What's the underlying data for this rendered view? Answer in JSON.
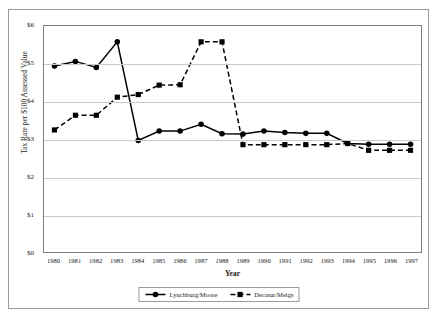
{
  "chart_data": {
    "type": "line",
    "title": "",
    "xlabel": "Year",
    "ylabel": "Tax Rate per $100 Assessed Value",
    "x": [
      1980,
      1981,
      1982,
      1983,
      1984,
      1985,
      1986,
      1987,
      1988,
      1989,
      1990,
      1991,
      1992,
      1993,
      1994,
      1995,
      1996,
      1997
    ],
    "categories": [
      "1980",
      "1981",
      "1982",
      "1983",
      "1984",
      "1985",
      "1986",
      "1987",
      "1988",
      "1989",
      "1990",
      "1991",
      "1992",
      "1993",
      "1994",
      "1995",
      "1996",
      "1997"
    ],
    "ylim": [
      0,
      6
    ],
    "yticks": [
      0,
      1,
      2,
      3,
      4,
      5,
      6
    ],
    "ytick_labels": [
      "$0",
      "$1",
      "$2",
      "$3",
      "$4",
      "$5",
      "$6"
    ],
    "grid": true,
    "legend_position": "bottom",
    "series": [
      {
        "name": "Lynchburg/Moore",
        "marker": "circle",
        "line_style": "solid",
        "color": "#000000",
        "values": [
          4.94,
          5.06,
          4.9,
          5.58,
          2.96,
          3.21,
          3.21,
          3.39,
          3.14,
          3.13,
          3.21,
          3.17,
          3.15,
          3.15,
          2.88,
          2.86,
          2.86,
          2.86
        ]
      },
      {
        "name": "Decatur/Meigs",
        "marker": "square",
        "line_style": "dashed",
        "color": "#000000",
        "values": [
          3.24,
          3.63,
          3.63,
          4.11,
          4.18,
          4.43,
          4.44,
          5.58,
          5.58,
          2.85,
          2.85,
          2.85,
          2.85,
          2.85,
          2.88,
          2.7,
          2.7,
          2.7
        ]
      }
    ]
  },
  "legend": {
    "items": [
      {
        "label": "Lynchburg/Moore"
      },
      {
        "label": "Decatur/Meigs"
      }
    ]
  }
}
